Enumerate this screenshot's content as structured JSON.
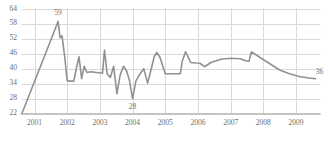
{
  "chart_data": {
    "type": "line",
    "title": "",
    "xlabel": "",
    "ylabel": "",
    "grid": true,
    "legend_position": "none",
    "line_color": "#919191",
    "text_color": "#6e6e6e",
    "gridline_color": "#d9d9d9",
    "axis_color": "#c4c4c4",
    "ylim": [
      22,
      64
    ],
    "ytick_labels": [
      "64",
      "58",
      "52",
      "46",
      "40",
      "34",
      "28",
      "22"
    ],
    "yticks": [
      64,
      58,
      52,
      46,
      40,
      34,
      28,
      22
    ],
    "xtick_labels": [
      "2001",
      "2002",
      "2003",
      "2004",
      "2005",
      "2006",
      "2007",
      "2008",
      "2009"
    ],
    "xticks": [
      2001,
      2002,
      2003,
      2004,
      2005,
      2006,
      2007,
      2008,
      2009
    ],
    "xlim": [
      2000.6,
      2009.75
    ],
    "annotations": [
      {
        "label": "59",
        "x": 2001.72,
        "y": 59
      },
      {
        "label": "28",
        "x": 2004.0,
        "y": 28
      },
      {
        "label": "36",
        "x": 2009.6,
        "y": 36
      }
    ],
    "x": [
      2000.62,
      2001.72,
      2001.78,
      2001.84,
      2001.92,
      2002.0,
      2002.08,
      2002.2,
      2002.28,
      2002.36,
      2002.44,
      2002.52,
      2002.6,
      2002.72,
      2002.84,
      2002.96,
      2003.08,
      2003.14,
      2003.22,
      2003.32,
      2003.42,
      2003.52,
      2003.62,
      2003.72,
      2003.82,
      2003.9,
      2004.0,
      2004.1,
      2004.22,
      2004.34,
      2004.46,
      2004.58,
      2004.66,
      2004.74,
      2004.84,
      2005.0,
      2005.3,
      2005.46,
      2005.52,
      2005.62,
      2005.78,
      2005.94,
      2006.06,
      2006.2,
      2006.4,
      2006.7,
      2007.0,
      2007.3,
      2007.45,
      2007.56,
      2007.64,
      2007.9,
      2008.2,
      2008.5,
      2008.8,
      2009.1,
      2009.4,
      2009.6
    ],
    "y": [
      22.2,
      59.0,
      52.5,
      53.2,
      45.0,
      35.2,
      35.0,
      35.0,
      40.2,
      44.8,
      36.0,
      41.0,
      38.5,
      38.8,
      38.6,
      38.4,
      38.2,
      47.5,
      38.0,
      36.5,
      41.0,
      30.0,
      37.5,
      41.0,
      39.0,
      35.5,
      28.0,
      35.0,
      37.8,
      40.0,
      34.2,
      40.5,
      44.8,
      46.5,
      44.5,
      38.0,
      38.0,
      38.0,
      43.0,
      46.8,
      42.5,
      42.3,
      42.2,
      40.8,
      42.5,
      43.8,
      44.2,
      44.0,
      43.2,
      43.0,
      46.8,
      44.5,
      42.0,
      39.5,
      38.0,
      36.9,
      36.3,
      36.0
    ]
  }
}
